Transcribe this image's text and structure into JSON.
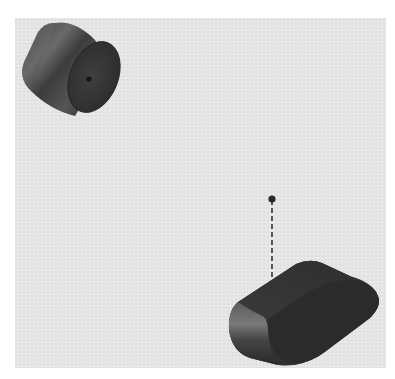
{
  "scene": {
    "background_color": "#e4e4e4",
    "objects": [
      {
        "name": "cylinder",
        "kind": "cylinder",
        "color": "#3a3a3a"
      },
      {
        "name": "point-marker",
        "kind": "point",
        "color": "#2a2a2a"
      },
      {
        "name": "projection-line",
        "kind": "dashed-line",
        "color": "#333333"
      },
      {
        "name": "rounded-block",
        "kind": "stadium-extrusion",
        "color": "#333333"
      }
    ]
  }
}
